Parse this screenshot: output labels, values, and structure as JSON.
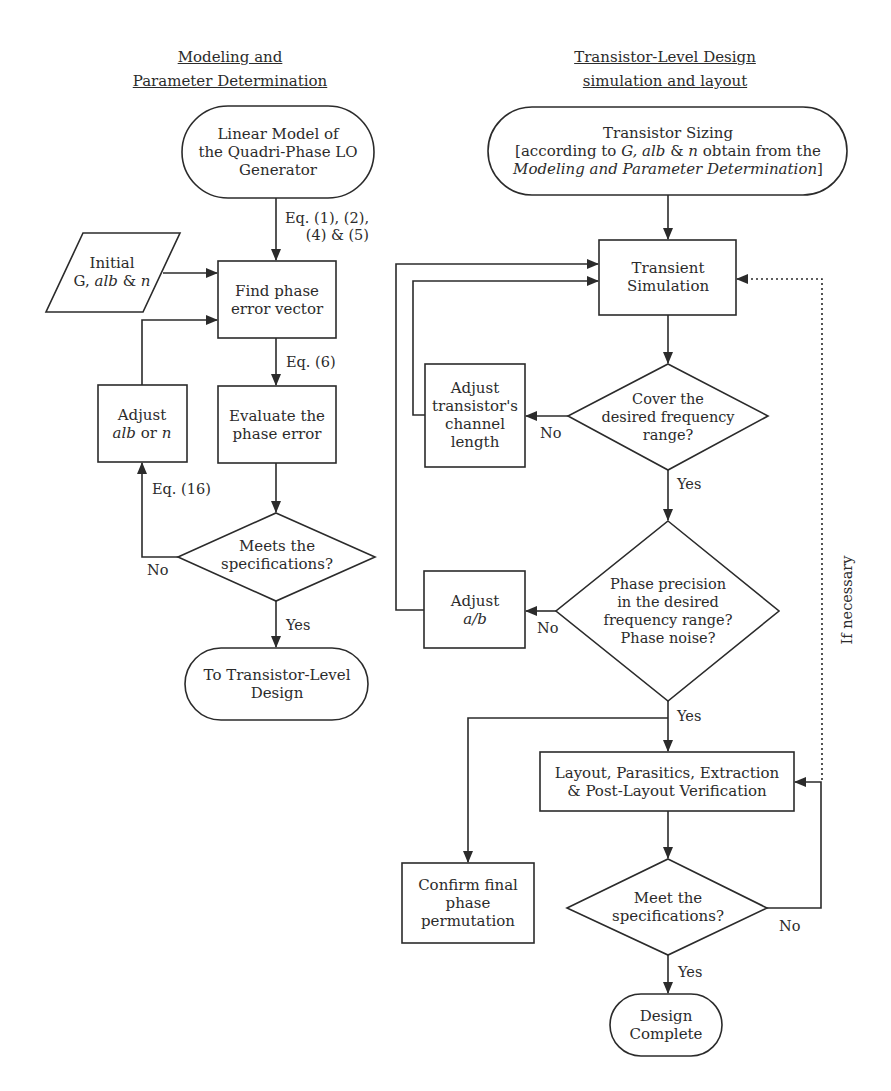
{
  "headings": {
    "left_line1": "Modeling and",
    "left_line2": "Parameter Determination",
    "right_line1": "Transistor-Level Design",
    "right_line2": "simulation and layout"
  },
  "left_flow": {
    "linear_model": [
      "Linear Model of",
      "the Quadri-Phase LO",
      "Generator"
    ],
    "eq_1_2_4_5": [
      "Eq. (1), (2),",
      "(4) & (5)"
    ],
    "initial": {
      "line1": "Initial",
      "line2_prefix": "G, ",
      "line2_italic": "alb",
      "line2_mid": " & ",
      "line2_italic2": "n"
    },
    "find_phase": [
      "Find phase",
      "error vector"
    ],
    "eq_6": "Eq. (6)",
    "evaluate": [
      "Evaluate the",
      "phase error"
    ],
    "adjust_alb": {
      "line1": "Adjust",
      "italic": "alb",
      "mid": " or ",
      "italic2": "n"
    },
    "eq_16": "Eq. (16)",
    "meets": [
      "Meets the",
      "specifications?"
    ],
    "no": "No",
    "yes": "Yes",
    "to_transistor": [
      "To Transistor-Level",
      "Design"
    ]
  },
  "right_flow": {
    "sizing": {
      "line1": "Transistor Sizing",
      "line2_a": "[according to ",
      "line2_G": "G, alb",
      "line2_b": " & ",
      "line2_n": "n",
      "line2_c": " obtain from the",
      "line3_italic": "Modeling and Parameter Determination",
      "line3_end": "]"
    },
    "transient": [
      "Transient",
      "Simulation"
    ],
    "cover": [
      "Cover the",
      "desired frequency",
      "range?"
    ],
    "adjust_channel": [
      "Adjust",
      "transistor's",
      "channel",
      "length"
    ],
    "no_1": "No",
    "yes_1": "Yes",
    "phase_precision": [
      "Phase precision",
      "in the desired",
      "frequency range?",
      "Phase noise?"
    ],
    "adjust_ab": {
      "line1": "Adjust",
      "italic": "a/b"
    },
    "no_2": "No",
    "yes_2": "Yes",
    "layout": [
      "Layout, Parasitics, Extraction",
      "& Post-Layout Verification"
    ],
    "confirm": [
      "Confirm final",
      "phase",
      "permutation"
    ],
    "meet": [
      "Meet the",
      "specifications?"
    ],
    "no_3": "No",
    "yes_3": "Yes",
    "design_complete": [
      "Design",
      "Complete"
    ],
    "if_necessary": "If necessary"
  },
  "colors": {
    "stroke": "#2b2b2b",
    "background": "#ffffff"
  }
}
